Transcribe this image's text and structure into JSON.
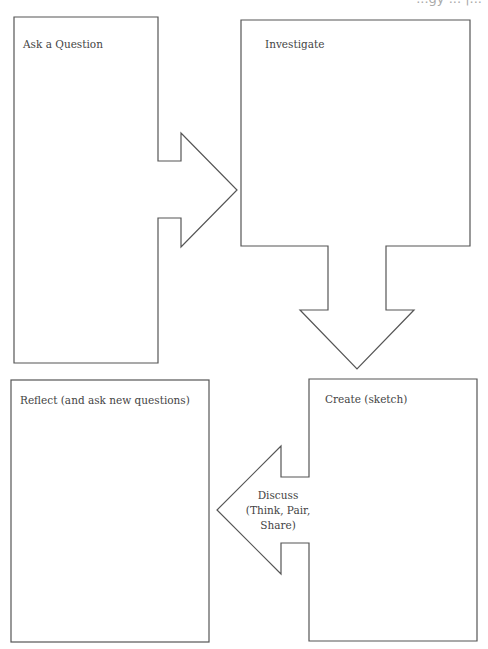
{
  "header": {
    "partial_text": "...gy ... |..."
  },
  "diagram": {
    "stroke_color": "#555555",
    "background": "#ffffff",
    "steps": [
      {
        "id": "ask",
        "label": "Ask a Question"
      },
      {
        "id": "investigate",
        "label": "Investigate"
      },
      {
        "id": "create",
        "label": "Create (sketch)"
      },
      {
        "id": "reflect",
        "label": "Reflect (and ask new questions)"
      }
    ],
    "arrows": [
      {
        "from": "ask",
        "to": "investigate",
        "direction": "right",
        "label": ""
      },
      {
        "from": "investigate",
        "to": "create",
        "direction": "down",
        "label": ""
      },
      {
        "from": "create",
        "to": "reflect",
        "direction": "left",
        "label_lines": [
          "Discuss",
          "(Think, Pair,",
          "Share)"
        ]
      }
    ]
  }
}
